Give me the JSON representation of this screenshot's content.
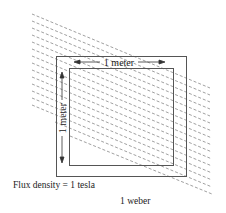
{
  "diagram": {
    "type": "magnetic-flux-illustration",
    "width_label": "1 meter",
    "height_label": "1 meter",
    "flux_density_label": "Flux density = 1 tesla",
    "flux_label": "1 weber",
    "colors": {
      "line": "#555555",
      "field_lines": "#777777",
      "text": "#222222",
      "background": "#ffffff"
    }
  }
}
